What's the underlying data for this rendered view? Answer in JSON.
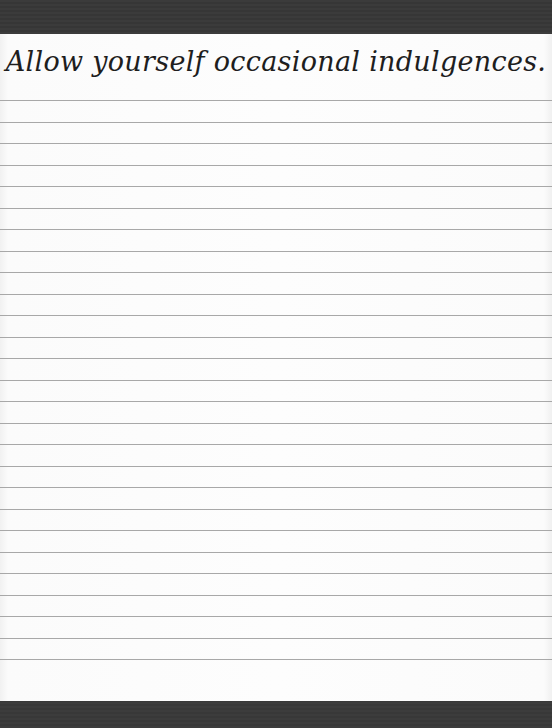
{
  "notepad": {
    "heading": "Allow yourself occasional indulgences.",
    "line_count": 27,
    "first_line_y": 66,
    "line_spacing": 21.5,
    "colors": {
      "band": "#3a3a3a",
      "paper": "#fdfdfd",
      "rule": "#a8a8a8",
      "ink": "#1e1e1e"
    }
  }
}
